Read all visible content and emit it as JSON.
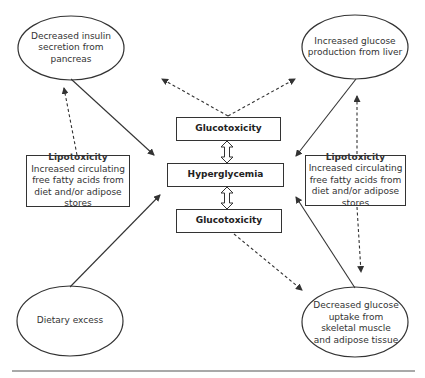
{
  "diagram": {
    "ellipses": {
      "top_left": {
        "label": "Decreased insulin secretion from pancreas"
      },
      "top_right": {
        "label": "Increased glucose production from liver"
      },
      "bottom_left": {
        "label": "Dietary excess"
      },
      "bottom_right": {
        "label": "Decreased glucose uptake from skeletal muscle and adipose tissue"
      }
    },
    "center": {
      "top_box": {
        "label": "Glucotoxicity"
      },
      "middle_box": {
        "label": "Hyperglycemia"
      },
      "bottom_box": {
        "label": "Glucotoxicity"
      }
    },
    "lipotoxicity_left": {
      "title": "Lipotoxicity",
      "body": "Increased circulating free fatty acids from diet and/or adipose stores"
    },
    "lipotoxicity_right": {
      "title": "Lipotoxicity",
      "body": "Increased circulating free fatty acids from diet and/or adipose stores"
    },
    "colors": {
      "stroke": "#333333",
      "background": "#ffffff"
    }
  }
}
